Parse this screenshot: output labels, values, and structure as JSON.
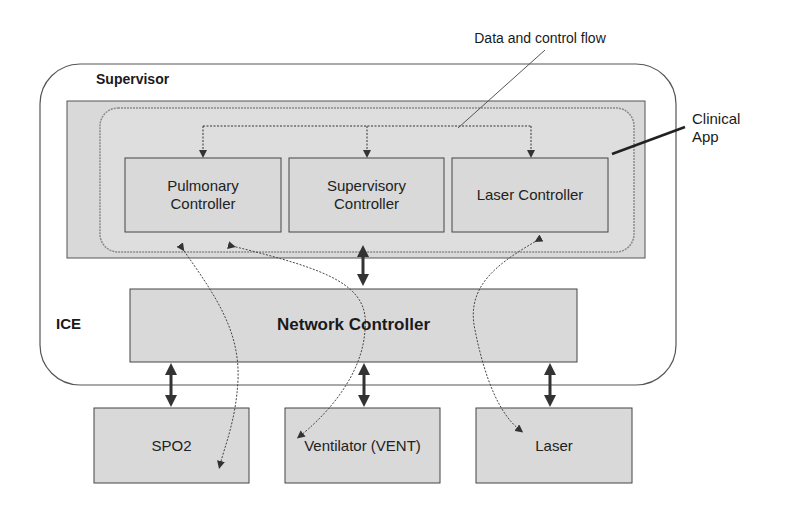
{
  "diagram": {
    "annotations": {
      "data_flow_label": "Data and control flow",
      "clinical_app_label_line1": "Clinical",
      "clinical_app_label_line2": "App"
    },
    "containers": {
      "supervisor_label": "Supervisor",
      "ice_label": "ICE"
    },
    "controllers": [
      {
        "line1": "Pulmonary",
        "line2": "Controller"
      },
      {
        "line1": "Supervisory",
        "line2": "Controller"
      },
      {
        "line1": "Laser Controller",
        "line2": ""
      }
    ],
    "network_controller": "Network Controller",
    "devices": [
      {
        "label": "SPO2"
      },
      {
        "label": "Ventilator (VENT)"
      },
      {
        "label": "Laser"
      }
    ],
    "colors": {
      "box_fill": "#d9d9d9",
      "outline": "#555555",
      "arrow": "#333333"
    }
  }
}
